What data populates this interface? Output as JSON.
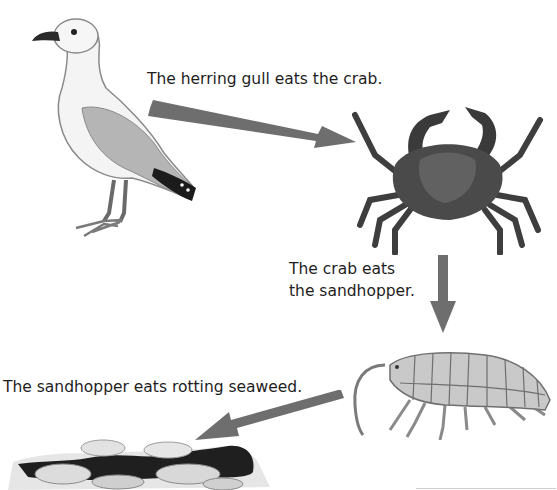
{
  "diagram": {
    "type": "food-chain",
    "organisms": [
      {
        "id": "herring-gull",
        "name": "herring gull"
      },
      {
        "id": "crab",
        "name": "crab"
      },
      {
        "id": "sandhopper",
        "name": "sandhopper"
      },
      {
        "id": "seaweed",
        "name": "rotting seaweed"
      }
    ],
    "links": [
      {
        "from": "herring-gull",
        "to": "crab",
        "caption": "The herring gull eats the crab."
      },
      {
        "from": "crab",
        "to": "sandhopper",
        "caption_line1": "The crab eats",
        "caption_line2": "the sandhopper."
      },
      {
        "from": "sandhopper",
        "to": "seaweed",
        "caption": "The sandhopper eats rotting seaweed."
      }
    ],
    "colors": {
      "arrow": "#6e6e6e",
      "text": "#1e1e1e",
      "background": "#ffffff"
    }
  }
}
